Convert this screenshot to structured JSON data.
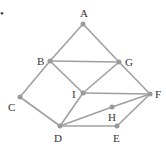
{
  "diagram": {
    "type": "graph",
    "colors": {
      "edge": "#a0a0a0",
      "node": "#9a9a9a",
      "label": "#333333"
    },
    "marker": "•",
    "nodes": [
      {
        "id": "A",
        "label": "A",
        "x": 83,
        "y": 24,
        "lx": 80,
        "ly": 17
      },
      {
        "id": "B",
        "label": "B",
        "x": 50,
        "y": 61,
        "lx": 37,
        "ly": 65
      },
      {
        "id": "G",
        "label": "G",
        "x": 119,
        "y": 62,
        "lx": 125,
        "ly": 66
      },
      {
        "id": "I",
        "label": "I",
        "x": 83,
        "y": 93,
        "lx": 72,
        "ly": 98
      },
      {
        "id": "C",
        "label": "C",
        "x": 20,
        "y": 97,
        "lx": 8,
        "ly": 111
      },
      {
        "id": "F",
        "label": "F",
        "x": 150,
        "y": 94,
        "lx": 155,
        "ly": 98
      },
      {
        "id": "H",
        "label": "H",
        "x": 112,
        "y": 107,
        "lx": 108,
        "ly": 121
      },
      {
        "id": "D",
        "label": "D",
        "x": 60,
        "y": 126,
        "lx": 54,
        "ly": 142
      },
      {
        "id": "E",
        "label": "E",
        "x": 117,
        "y": 126,
        "lx": 113,
        "ly": 142
      }
    ],
    "edges": [
      [
        "A",
        "B"
      ],
      [
        "A",
        "G"
      ],
      [
        "B",
        "G"
      ],
      [
        "B",
        "I"
      ],
      [
        "B",
        "C"
      ],
      [
        "G",
        "I"
      ],
      [
        "G",
        "F"
      ],
      [
        "I",
        "F"
      ],
      [
        "I",
        "D"
      ],
      [
        "C",
        "D"
      ],
      [
        "D",
        "H"
      ],
      [
        "H",
        "F"
      ],
      [
        "D",
        "E"
      ],
      [
        "E",
        "F"
      ]
    ]
  }
}
